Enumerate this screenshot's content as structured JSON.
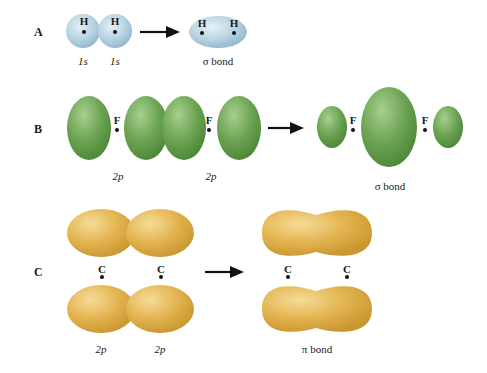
{
  "rows": [
    {
      "label": "A",
      "atom": "H",
      "before_captions": [
        "1s",
        "1s"
      ],
      "after_caption": "σ bond",
      "color": "#b8d4e2"
    },
    {
      "label": "B",
      "atom": "F",
      "before_captions": [
        "2p",
        "2p"
      ],
      "after_caption": "σ bond",
      "color": "#6aa353"
    },
    {
      "label": "C",
      "atom": "C",
      "before_captions": [
        "2p",
        "2p"
      ],
      "after_caption": "π bond",
      "color": "#e0b24e"
    }
  ],
  "colors": {
    "s_orbital": "#b8d4e2",
    "p_orbital_F": "#6aa353",
    "p_orbital_C": "#e0b24e",
    "arrow": "#111111"
  }
}
